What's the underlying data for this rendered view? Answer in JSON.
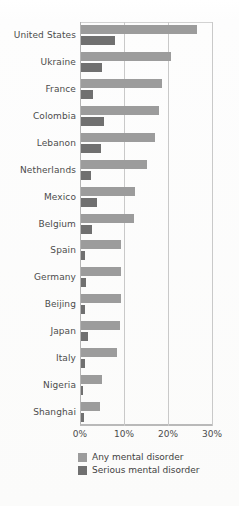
{
  "chart_data": {
    "type": "bar",
    "orientation": "horizontal",
    "title": "",
    "subtitle": "",
    "xlabel": "",
    "ylabel": "",
    "xlim": [
      0,
      30
    ],
    "xticks": [
      "0%",
      "10%",
      "20%",
      "30%"
    ],
    "xtick_values": [
      0,
      10,
      20,
      30
    ],
    "grid": true,
    "legend_position": "bottom",
    "categories": [
      "United States",
      "Ukraine",
      "France",
      "Colombia",
      "Lebanon",
      "Netherlands",
      "Mexico",
      "Belgium",
      "Spain",
      "Germany",
      "Beijing",
      "Japan",
      "Italy",
      "Nigeria",
      "Shanghai"
    ],
    "series": [
      {
        "name": "Any mental disorder",
        "color": "#9c9c9c",
        "values": [
          26.4,
          20.5,
          18.4,
          17.8,
          16.9,
          14.9,
          12.2,
          12.0,
          9.2,
          9.1,
          9.1,
          8.8,
          8.2,
          4.7,
          4.3
        ]
      },
      {
        "name": "Serious mental disorder",
        "color": "#707070",
        "values": [
          7.7,
          4.8,
          2.7,
          5.2,
          4.6,
          2.3,
          3.7,
          2.4,
          1.0,
          1.2,
          0.9,
          1.5,
          1.0,
          0.4,
          0.6
        ]
      }
    ]
  },
  "legend": {
    "items": [
      {
        "label": "Any mental disorder",
        "color": "#9c9c9c"
      },
      {
        "label": "Serious mental disorder",
        "color": "#707070"
      }
    ]
  }
}
